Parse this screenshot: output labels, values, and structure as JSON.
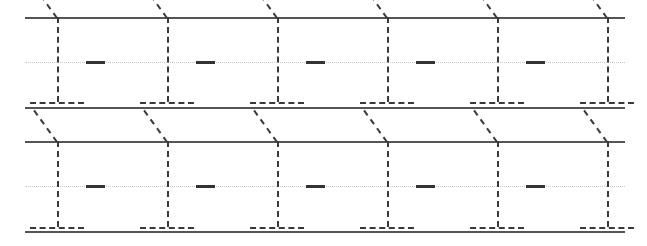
{
  "worksheet": {
    "title": "Handwriting Practice Worksheet",
    "description": "Dashed tracing guides for the numeral 1 on ruled handwriting lines",
    "width": 647,
    "height": 246,
    "background_color": "#ffffff",
    "glyph": "1",
    "traces_per_row": 6,
    "row_count": 2
  },
  "colors": {
    "solid_rule": "#555555",
    "dotted_rule": "#c9c9c9",
    "dashed_stroke": "#3a3a3a",
    "tick_mark": "#333333"
  },
  "geometry": {
    "rule_left": 25,
    "rule_right": 625,
    "glyph_pitch": 110,
    "glyph_x_positions": [
      57,
      167,
      277,
      387,
      497,
      607
    ],
    "stem_width_px": 2,
    "flag_length_px": 39,
    "flag_angle_deg": -54,
    "base_half_width_px": 27,
    "tick_offset_x": 29,
    "tick_width_px": 19,
    "tick_height_px": 3,
    "dash_pattern": "4px dash, 4px gap"
  },
  "rows": [
    {
      "name": "row-1",
      "top_rule_y": 17,
      "mid_rule_y": 62,
      "base_rule_y": 102,
      "bottom_rule_y": 107
    },
    {
      "name": "row-2",
      "top_rule_y": 141,
      "mid_rule_y": 186,
      "base_rule_y": 227,
      "bottom_rule_y": 231
    }
  ]
}
